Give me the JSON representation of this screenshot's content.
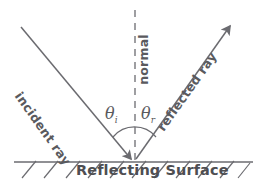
{
  "diagram": {
    "labels": {
      "incident_ray": "incident ray",
      "reflected_ray": "reflected ray",
      "normal": "normal",
      "surface": "Reflecting Surface",
      "theta_incidence": "θ",
      "theta_incidence_sub": "i",
      "theta_reflection": "θ",
      "theta_reflection_sub": "r"
    },
    "colors": {
      "line": "#6b6b70",
      "text": "#57575a",
      "surface_text": "#4e4e52",
      "background": "#ffffff"
    },
    "geometry": {
      "contact_point": [
        134,
        162
      ],
      "incident_start": [
        21,
        27
      ],
      "reflected_end": [
        232,
        24
      ],
      "normal_top": [
        135,
        10
      ],
      "normal_bottom": [
        135,
        162
      ],
      "surface_line": [
        14,
        162,
        253,
        162
      ],
      "arc_radius": 30,
      "hatch_count": 11
    }
  }
}
